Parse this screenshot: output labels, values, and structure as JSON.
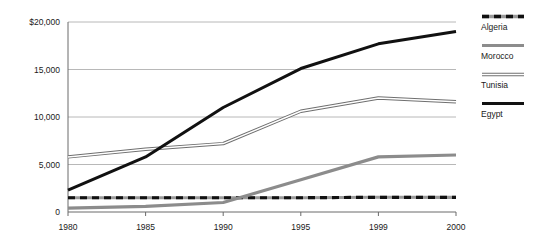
{
  "chart_data": {
    "type": "line",
    "title": "",
    "xlabel": "",
    "ylabel": "",
    "categories": [
      "1980",
      "1985",
      "1990",
      "1995",
      "1999",
      "2000"
    ],
    "ylim": [
      0,
      20000
    ],
    "yticks": [
      0,
      5000,
      10000,
      15000,
      20000
    ],
    "ytick_labels": [
      "0",
      "5,000",
      "10,000",
      "15,000",
      "$20,000"
    ],
    "grid": "horizontal",
    "legend_position": "right",
    "series": [
      {
        "name": "Algeria",
        "style": "dashed",
        "color": "#111111",
        "values": [
          1500,
          1500,
          1500,
          1500,
          1550,
          1550
        ]
      },
      {
        "name": "Morocco",
        "style": "solid-gray",
        "color": "#8c8c8c",
        "values": [
          400,
          600,
          1000,
          3400,
          5800,
          6000
        ]
      },
      {
        "name": "Tunisia",
        "style": "outline",
        "color": "#7a7a7a",
        "values": [
          5800,
          6600,
          7200,
          10600,
          12000,
          11600
        ]
      },
      {
        "name": "Egypt",
        "style": "solid-black",
        "color": "#111111",
        "values": [
          2300,
          5800,
          11000,
          15100,
          17700,
          19000
        ]
      }
    ]
  },
  "legend": {
    "entries": [
      {
        "label": "Algeria",
        "swatch": "dashed-line-swatch"
      },
      {
        "label": "Morocco",
        "swatch": "gray-line-swatch"
      },
      {
        "label": "Tunisia",
        "swatch": "outline-line-swatch"
      },
      {
        "label": "Egypt",
        "swatch": "black-line-swatch"
      }
    ]
  },
  "colors": {
    "axis": "#4a4a4a",
    "grid": "#b0b0b0",
    "text": "#1a1a1a",
    "background": "#ffffff"
  }
}
